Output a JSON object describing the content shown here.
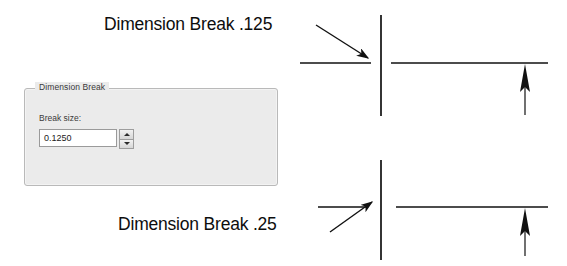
{
  "dialog": {
    "group_title": "Dimension Break",
    "field_label": "Break size:",
    "break_size_value": "0.1250",
    "spinner_up": "▲",
    "spinner_down": "▼",
    "panel_color": "#ebebeb",
    "border_color": "#b9b9b9"
  },
  "annotations": {
    "top_label": "Dimension Break .125",
    "bottom_label": "Dimension Break .25"
  },
  "drawings": {
    "line_color": "#111111",
    "top": {
      "break_size": ".125",
      "extension_line": {
        "x": 381,
        "y1": 15,
        "y2": 116
      },
      "left_segment": {
        "x1": 300,
        "x2": 371,
        "y": 63
      },
      "right_segment": {
        "x1": 391,
        "x2": 548,
        "y": 63
      },
      "arrow_marker": {
        "x": 525,
        "y_tip": 65,
        "y_tail": 115
      }
    },
    "bottom": {
      "break_size": ".25",
      "extension_line": {
        "x": 381,
        "y1": 160,
        "y2": 260
      },
      "left_segment": {
        "x1": 318,
        "x2": 366,
        "y": 207
      },
      "right_segment": {
        "x1": 396,
        "x2": 548,
        "y": 207
      },
      "arrow_marker": {
        "x": 525,
        "y_tip": 209,
        "y_tail": 256
      }
    }
  },
  "leaders": {
    "top": {
      "from_x": 316,
      "from_y": 25,
      "to_x": 368,
      "to_y": 58
    },
    "bottom": {
      "from_x": 330,
      "from_y": 232,
      "to_x": 372,
      "to_y": 202
    }
  }
}
